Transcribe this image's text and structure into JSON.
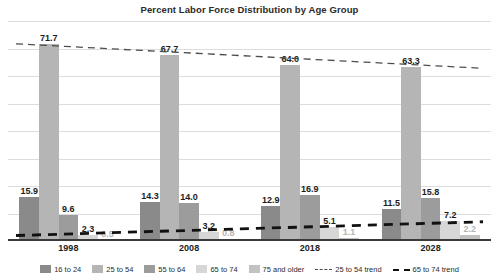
{
  "chart_data": {
    "type": "bar",
    "title": "Percent Labor Force Distribution by Age Group",
    "xlabel": "",
    "ylabel": "",
    "categories": [
      "1998",
      "2008",
      "2018",
      "2028"
    ],
    "ylim": [
      0,
      80
    ],
    "grid": true,
    "gridline_count": 8,
    "legend_position": "bottom",
    "series": [
      {
        "name": "16 to 24",
        "color": "#8a8a8a",
        "values": [
          15.9,
          14.3,
          12.9,
          11.5
        ]
      },
      {
        "name": "25 to 54",
        "color": "#b5b5b5",
        "values": [
          71.7,
          67.7,
          64.0,
          63.3
        ]
      },
      {
        "name": "55 to 64",
        "color": "#9c9c9c",
        "values": [
          9.6,
          14.0,
          16.9,
          15.8
        ]
      },
      {
        "name": "65 to 74",
        "color": "#d6d6d6",
        "values": [
          2.3,
          3.2,
          5.1,
          7.2
        ]
      },
      {
        "name": "75 and older",
        "color": "#c2c2c2",
        "values": [
          0.5,
          0.8,
          1.1,
          2.2
        ]
      }
    ],
    "trendlines": [
      {
        "name": "25 to 54 trend",
        "style": "thin-dashed",
        "color": "#4d4d4d",
        "from": 71.7,
        "to": 62.8
      },
      {
        "name": "65 to 74 trend",
        "style": "thick-dashed",
        "color": "#111111",
        "from": 2.0,
        "to": 7.0
      }
    ],
    "labels": {
      "1998": [
        "15.9",
        "71.7",
        "9.6",
        "2.3",
        "0.5"
      ],
      "2008": [
        "14.3",
        "67.7",
        "14.0",
        "3.2",
        "0.8"
      ],
      "2018": [
        "12.9",
        "64.0",
        "16.9",
        "5.1",
        "1.1"
      ],
      "2028": [
        "11.5",
        "63.3",
        "15.8",
        "7.2",
        "2.2"
      ]
    }
  },
  "legend": {
    "items": [
      {
        "label": "16 to 24",
        "kind": "swatch",
        "color": "#8a8a8a"
      },
      {
        "label": "25 to 54",
        "kind": "swatch",
        "color": "#b5b5b5"
      },
      {
        "label": "55 to 64",
        "kind": "swatch",
        "color": "#9c9c9c"
      },
      {
        "label": "65 to 74",
        "kind": "swatch",
        "color": "#d6d6d6"
      },
      {
        "label": "75 and older",
        "kind": "swatch",
        "color": "#c2c2c2"
      },
      {
        "label": "25 to 54 trend",
        "kind": "thin-line"
      },
      {
        "label": "65 to 74 trend",
        "kind": "thick-line"
      }
    ]
  }
}
